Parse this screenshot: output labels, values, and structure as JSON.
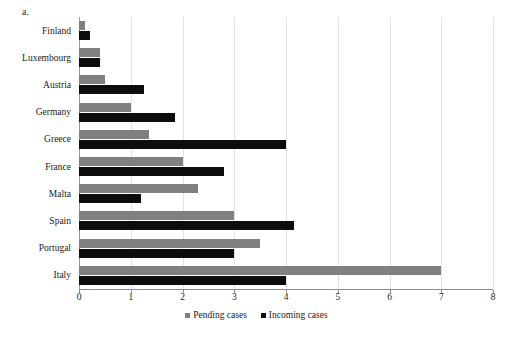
{
  "panel": {
    "label": "a."
  },
  "chart_data": {
    "type": "bar",
    "orientation": "horizontal",
    "title": "",
    "xlabel": "",
    "ylabel": "",
    "xlim": [
      0,
      8
    ],
    "xticks": [
      0,
      1,
      2,
      3,
      4,
      5,
      6,
      7,
      8
    ],
    "grid": true,
    "legend_position": "bottom",
    "categories": [
      "Finland",
      "Luxembourg",
      "Austria",
      "Germany",
      "Greece",
      "France",
      "Malta",
      "Spain",
      "Portugal",
      "Italy"
    ],
    "series": [
      {
        "name": "Pending cases",
        "color": "#808080",
        "values": [
          0.12,
          0.4,
          0.5,
          1.0,
          1.35,
          2.0,
          2.3,
          3.0,
          3.5,
          7.0
        ]
      },
      {
        "name": "Incoming cases",
        "color": "#0d0d0d",
        "values": [
          0.22,
          0.4,
          1.25,
          1.85,
          4.0,
          2.8,
          1.2,
          4.15,
          3.0,
          4.0
        ]
      }
    ]
  }
}
